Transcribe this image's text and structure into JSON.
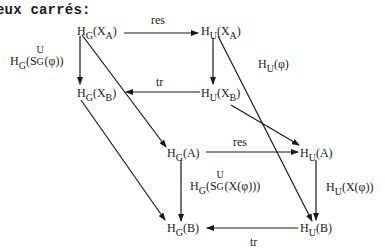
{
  "heading": "eux carrés:",
  "nodes": {
    "hg_xa": {
      "H": "H",
      "sub": "G",
      "open": "(X",
      "sub2": "A",
      "close": ")"
    },
    "hu_xa": {
      "H": "H",
      "sub": "U",
      "open": "(X",
      "sub2": "A",
      "close": ")"
    },
    "hg_xb": {
      "H": "H",
      "sub": "G",
      "open": "(X",
      "sub2": "B",
      "close": ")"
    },
    "hu_xb": {
      "H": "H",
      "sub": "U",
      "open": "(X",
      "sub2": "B",
      "close": ")"
    },
    "hg_a": {
      "H": "H",
      "sub": "G",
      "rest": "(A)"
    },
    "hu_a": {
      "H": "H",
      "sub": "U",
      "rest": "(A)"
    },
    "hg_b": {
      "H": "H",
      "sub": "G",
      "rest": "(B)"
    },
    "hu_b": {
      "H": "H",
      "sub": "U",
      "rest": "(B)"
    }
  },
  "labels": {
    "res_top": "res",
    "tr_mid": "tr",
    "res_bottom": "res",
    "tr_bottom": "tr",
    "left_vertical": {
      "H": "H",
      "sub": "G",
      "open": "(S",
      "sup_s": "U",
      "sub_s": "G",
      "close": "(φ))"
    },
    "right_diag": {
      "H": "H",
      "sub": "U",
      "rest": "(φ)"
    },
    "inner_vertical": {
      "H": "H",
      "sub": "G",
      "open": "(S",
      "sup_s": "U",
      "sub_s": "G",
      "close": "(X(φ)))"
    },
    "right_vertical": {
      "H": "H",
      "sub": "U",
      "rest": "(X(φ))"
    }
  },
  "colors": {
    "ink": "#1a1a1a",
    "background": "#ffffff"
  }
}
